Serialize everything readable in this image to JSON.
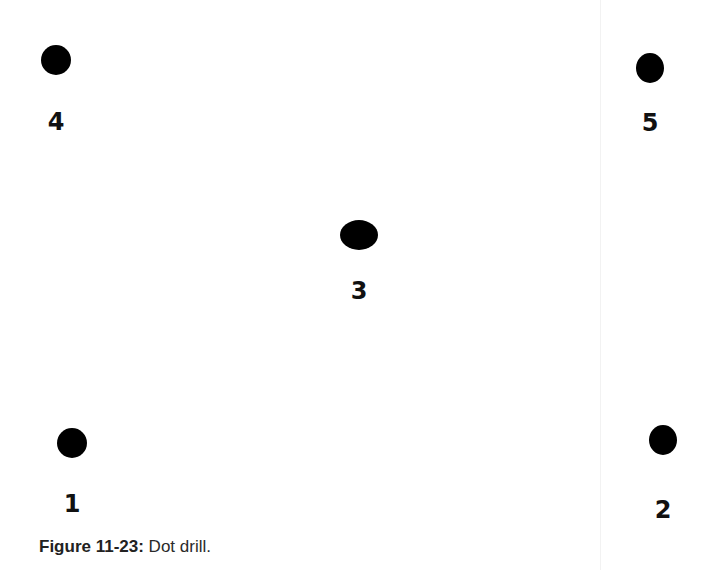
{
  "figure": {
    "dots": [
      {
        "label": "1",
        "x": 72,
        "y": 443,
        "rx": 15,
        "ry": 15,
        "label_y": 492
      },
      {
        "label": "2",
        "x": 663,
        "y": 440,
        "rx": 14,
        "ry": 15,
        "label_y": 498
      },
      {
        "label": "3",
        "x": 359,
        "y": 235,
        "rx": 19,
        "ry": 15,
        "label_y": 279
      },
      {
        "label": "4",
        "x": 56,
        "y": 60,
        "rx": 15,
        "ry": 15,
        "label_y": 110
      },
      {
        "label": "5",
        "x": 650,
        "y": 68,
        "rx": 14,
        "ry": 15,
        "label_y": 111
      }
    ],
    "caption": {
      "label": "Figure 11-23:",
      "text": "Dot drill."
    }
  }
}
